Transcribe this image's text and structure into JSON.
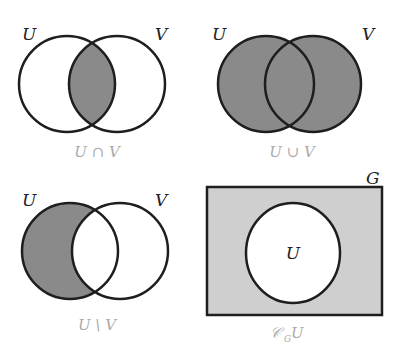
{
  "colors": {
    "stroke": "#1e1e1e",
    "shade": "#8a8a8a",
    "light_shade": "#cfcfcf",
    "background": "#ffffff",
    "caption": "#aaaaaa"
  },
  "panels": [
    {
      "id": "intersection",
      "set_labels": [
        "U",
        "V"
      ],
      "caption": "U ∩ V"
    },
    {
      "id": "union",
      "set_labels": [
        "U",
        "V"
      ],
      "caption": "U ∪ V"
    },
    {
      "id": "difference",
      "set_labels": [
        "U",
        "V"
      ],
      "caption": "U \\ V"
    },
    {
      "id": "complement",
      "universe_label": "G",
      "set_label": "U",
      "caption_main": "𝒞",
      "caption_sub": "G",
      "caption_tail": "U"
    }
  ]
}
